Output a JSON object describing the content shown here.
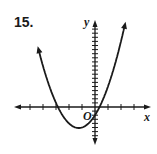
{
  "problem": {
    "number": "15."
  },
  "chart_data": {
    "type": "line",
    "title": "",
    "xlabel": "x",
    "ylabel": "y",
    "origin_label": "O",
    "equation_estimate": "y = 2x^2 + 5x - 2",
    "x_range": [
      -6,
      4
    ],
    "y_range": [
      -6,
      20
    ],
    "x_tick_spacing": 1,
    "y_tick_spacing": 1,
    "grid": false,
    "series": [
      {
        "name": "parabola",
        "description": "upward-opening parabola",
        "roots": [
          -2.85,
          0.35
        ],
        "vertex": [
          -1.25,
          -5.1
        ],
        "y_intercept": -2,
        "x": [
          -4.4,
          -4,
          -3.5,
          -3,
          -2.5,
          -2,
          -1.5,
          -1.25,
          -1,
          -0.5,
          0,
          0.5,
          1,
          1.5,
          2,
          2.6
        ],
        "y": [
          16.7,
          10,
          4,
          -1,
          -2,
          -4,
          -5,
          -5.1,
          -5,
          -4,
          -2,
          1,
          5,
          10,
          16,
          24
        ]
      }
    ],
    "colors": {
      "stroke": "#1a1a1a",
      "background": "#ffffff"
    }
  }
}
